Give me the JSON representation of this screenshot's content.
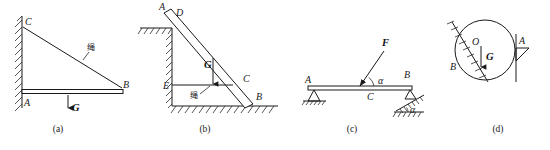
{
  "figure": {
    "background_color": "#ffffff",
    "ink_color": "#1a1a1a",
    "panel_count": 4
  },
  "panels": [
    {
      "key": "a",
      "caption": "(a)",
      "description": "Horizontal rod AB hinged to a vertical wall at A, supported by an inclined rope from wall point C to rod end B, with weight G hanging from the rod.",
      "labels": {
        "wall_top_point": "C",
        "hinge_point": "A",
        "rod_end": "B",
        "rope": "绳",
        "weight": "G"
      },
      "support_type": "vertical-wall-hatched",
      "members": [
        "rope CB",
        "rod AB"
      ]
    },
    {
      "key": "b",
      "caption": "(b)",
      "description": "Inclined beam AB leaning against a vertical wall at D and resting on the ground at B, held by a horizontal rope EC, with weight G acting downward.",
      "labels": {
        "beam_top": "A",
        "wall_contact": "D",
        "rope_beam_point": "C",
        "ground_contact": "B",
        "rope_wall_point": "E",
        "rope": "绳",
        "weight": "G"
      },
      "support_type": "wall-and-ground-hatched",
      "members": [
        "beam AB",
        "rope EC"
      ]
    },
    {
      "key": "c",
      "caption": "(c)",
      "description": "Horizontal beam AB on a pin support at A and a roller on an inclined plane at B, loaded at midpoint C by force F inclined at angle alpha to the beam.",
      "labels": {
        "left_support": "A",
        "right_support": "B",
        "load_point": "C",
        "force": "F",
        "force_angle": "α",
        "incline_angle": "α"
      },
      "support_type": "pin-left-roller-incline-right",
      "members": [
        "beam AB"
      ]
    },
    {
      "key": "d",
      "caption": "(d)",
      "description": "Circular cylinder of weight G resting in the corner between an inclined hatched wall at B and a vertical bracket at A, with centre O.",
      "labels": {
        "centre": "O",
        "weight": "G",
        "incline_contact": "B",
        "bracket_contact": "A"
      },
      "support_type": "incline-and-vertical-bracket",
      "members": [
        "cylinder"
      ]
    }
  ],
  "captions": {
    "a": "(a)",
    "b": "(b)",
    "c": "(c)",
    "d": "(d)"
  },
  "glyphs": {
    "rope_cn": "绳",
    "alpha": "α",
    "force_F": "F",
    "weight_G": "G",
    "point_A": "A",
    "point_B": "B",
    "point_C": "C",
    "point_D": "D",
    "point_E": "E",
    "point_O": "O"
  },
  "colors": {
    "ink": "#1a1a1a",
    "hatch": "#2a2a2a",
    "paper": "#ffffff"
  }
}
